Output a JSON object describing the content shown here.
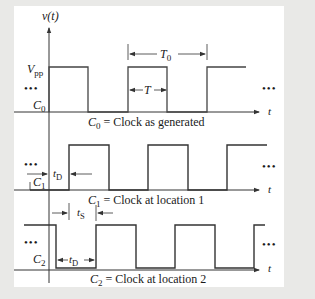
{
  "diagram": {
    "type": "timing-diagram",
    "y_axis_label": "v(t)",
    "x_axis_label": "t",
    "ellipsis": "•••",
    "colors": {
      "background": "#e9e9e7",
      "panel": "#ffffff",
      "line": "#333333",
      "text": "#1a1a1a"
    },
    "annotations": {
      "vpp": "V",
      "vpp_sub": "pp",
      "period": "T",
      "period_sub": "0",
      "high_time": "T",
      "delay": "t",
      "delay_sub": "D",
      "skew": "t",
      "skew_sub": "S"
    },
    "signals": [
      {
        "id": "C0",
        "name": "C",
        "sub": "0",
        "caption_name": "C",
        "caption_sub": "0",
        "caption_text": " = Clock as generated"
      },
      {
        "id": "C1",
        "name": "C",
        "sub": "1",
        "caption_name": "C",
        "caption_sub": "1",
        "caption_text": " = Clock at location 1"
      },
      {
        "id": "C2",
        "name": "C",
        "sub": "2",
        "caption_name": "C",
        "caption_sub": "2",
        "caption_text": " = Clock at location 2"
      }
    ]
  }
}
